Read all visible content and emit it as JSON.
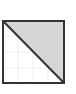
{
  "icon": {
    "name": "diagonal-split-square-icon",
    "fill_color": "#d6d6d6",
    "background_color": "#ffffff",
    "border_color": "#333333",
    "grid_color": "#eeeeee"
  }
}
